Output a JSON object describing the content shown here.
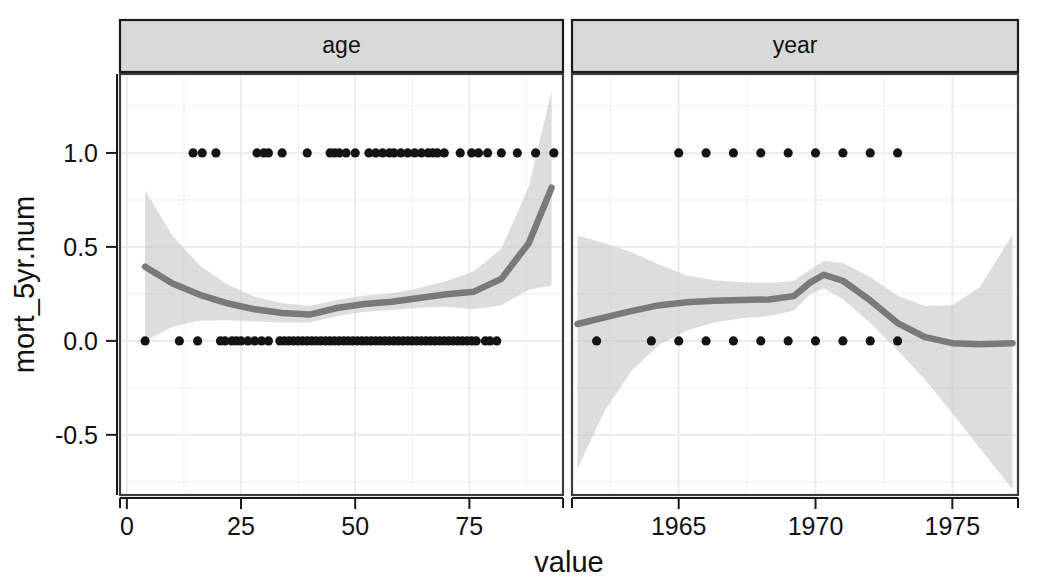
{
  "figure": {
    "xlabel": "value",
    "ylabel": "mort_5yr.num",
    "background": "#ffffff",
    "strip_fill": "#d9d9d9",
    "line_color": "#7a7a7a",
    "ribbon_color": "#c8c8c8",
    "point_color": "#141414"
  },
  "chart_data": {
    "type": "scatter",
    "title": "",
    "subtitle": "",
    "xlabel": "value",
    "ylabel": "mort_5yr.num",
    "grid": true,
    "legend": "none",
    "facet_variable": "variable",
    "facets": [
      {
        "label": "age",
        "xlabel": "value",
        "ylabel": "mort_5yr.num",
        "xticks": [
          0,
          25,
          50,
          75
        ],
        "xticklabels": [
          "0",
          "25",
          "50",
          "75"
        ],
        "yticks": [
          -0.5,
          0.0,
          0.5,
          1.0
        ],
        "yticklabels": [
          "-0.5",
          "0.0",
          "0.5",
          "1.0"
        ],
        "xlim": [
          -1.5,
          95.5
        ],
        "ylim": [
          -0.82,
          1.42
        ],
        "points": [
          {
            "x": 4.0,
            "y": 0.0
          },
          {
            "x": 14.5,
            "y": 1.0
          },
          {
            "x": 16.5,
            "y": 1.0
          },
          {
            "x": 19.5,
            "y": 1.0
          },
          {
            "x": 11.5,
            "y": 0.0
          },
          {
            "x": 15.5,
            "y": 0.0
          },
          {
            "x": 20.5,
            "y": 0.0
          },
          {
            "x": 21.5,
            "y": 0.0
          },
          {
            "x": 23.0,
            "y": 0.0
          },
          {
            "x": 24.0,
            "y": 0.0
          },
          {
            "x": 25.0,
            "y": 0.0
          },
          {
            "x": 26.5,
            "y": 0.0
          },
          {
            "x": 28.5,
            "y": 1.0
          },
          {
            "x": 30.0,
            "y": 1.0
          },
          {
            "x": 31.0,
            "y": 1.0
          },
          {
            "x": 34.0,
            "y": 1.0
          },
          {
            "x": 28.0,
            "y": 0.0
          },
          {
            "x": 29.5,
            "y": 0.0
          },
          {
            "x": 31.0,
            "y": 0.0
          },
          {
            "x": 33.5,
            "y": 0.0
          },
          {
            "x": 34.5,
            "y": 0.0
          },
          {
            "x": 35.5,
            "y": 0.0
          },
          {
            "x": 36.5,
            "y": 0.0
          },
          {
            "x": 37.5,
            "y": 0.0
          },
          {
            "x": 38.5,
            "y": 0.0
          },
          {
            "x": 39.5,
            "y": 0.0
          },
          {
            "x": 40.5,
            "y": 0.0
          },
          {
            "x": 41.5,
            "y": 0.0
          },
          {
            "x": 42.5,
            "y": 0.0
          },
          {
            "x": 43.5,
            "y": 0.0
          },
          {
            "x": 44.5,
            "y": 0.0
          },
          {
            "x": 39.5,
            "y": 1.0
          },
          {
            "x": 44.5,
            "y": 1.0
          },
          {
            "x": 45.5,
            "y": 1.0
          },
          {
            "x": 46.5,
            "y": 1.0
          },
          {
            "x": 48.0,
            "y": 1.0
          },
          {
            "x": 50.0,
            "y": 1.0
          },
          {
            "x": 45.5,
            "y": 0.0
          },
          {
            "x": 46.5,
            "y": 0.0
          },
          {
            "x": 47.5,
            "y": 0.0
          },
          {
            "x": 48.5,
            "y": 0.0
          },
          {
            "x": 49.5,
            "y": 0.0
          },
          {
            "x": 50.5,
            "y": 0.0
          },
          {
            "x": 51.5,
            "y": 0.0
          },
          {
            "x": 52.5,
            "y": 0.0
          },
          {
            "x": 53.5,
            "y": 0.0
          },
          {
            "x": 54.5,
            "y": 0.0
          },
          {
            "x": 55.5,
            "y": 0.0
          },
          {
            "x": 56.5,
            "y": 0.0
          },
          {
            "x": 57.5,
            "y": 0.0
          },
          {
            "x": 58.5,
            "y": 0.0
          },
          {
            "x": 53.0,
            "y": 1.0
          },
          {
            "x": 54.5,
            "y": 1.0
          },
          {
            "x": 56.0,
            "y": 1.0
          },
          {
            "x": 57.5,
            "y": 1.0
          },
          {
            "x": 58.5,
            "y": 1.0
          },
          {
            "x": 60.0,
            "y": 1.0
          },
          {
            "x": 61.5,
            "y": 1.0
          },
          {
            "x": 63.0,
            "y": 1.0
          },
          {
            "x": 64.5,
            "y": 1.0
          },
          {
            "x": 59.5,
            "y": 0.0
          },
          {
            "x": 60.5,
            "y": 0.0
          },
          {
            "x": 61.5,
            "y": 0.0
          },
          {
            "x": 62.5,
            "y": 0.0
          },
          {
            "x": 63.5,
            "y": 0.0
          },
          {
            "x": 64.5,
            "y": 0.0
          },
          {
            "x": 65.5,
            "y": 0.0
          },
          {
            "x": 66.5,
            "y": 0.0
          },
          {
            "x": 67.5,
            "y": 0.0
          },
          {
            "x": 68.5,
            "y": 0.0
          },
          {
            "x": 69.5,
            "y": 0.0
          },
          {
            "x": 70.5,
            "y": 0.0
          },
          {
            "x": 66.0,
            "y": 1.0
          },
          {
            "x": 67.0,
            "y": 1.0
          },
          {
            "x": 68.0,
            "y": 1.0
          },
          {
            "x": 69.5,
            "y": 1.0
          },
          {
            "x": 71.5,
            "y": 0.0
          },
          {
            "x": 72.5,
            "y": 0.0
          },
          {
            "x": 73.5,
            "y": 0.0
          },
          {
            "x": 74.5,
            "y": 0.0
          },
          {
            "x": 75.5,
            "y": 0.0
          },
          {
            "x": 76.5,
            "y": 0.0
          },
          {
            "x": 73.0,
            "y": 1.0
          },
          {
            "x": 75.5,
            "y": 1.0
          },
          {
            "x": 77.0,
            "y": 1.0
          },
          {
            "x": 79.0,
            "y": 1.0
          },
          {
            "x": 82.0,
            "y": 1.0
          },
          {
            "x": 85.5,
            "y": 1.0
          },
          {
            "x": 78.5,
            "y": 0.0
          },
          {
            "x": 79.5,
            "y": 0.0
          },
          {
            "x": 81.0,
            "y": 0.0
          },
          {
            "x": 89.5,
            "y": 1.0
          },
          {
            "x": 93.5,
            "y": 1.0
          }
        ],
        "smooth": {
          "x": [
            4,
            10,
            16,
            22,
            28,
            34,
            40,
            46,
            52,
            58,
            64,
            70,
            76,
            82,
            88,
            93
          ],
          "y": [
            0.395,
            0.305,
            0.245,
            0.2,
            0.168,
            0.148,
            0.14,
            0.175,
            0.196,
            0.208,
            0.228,
            0.248,
            0.262,
            0.33,
            0.52,
            0.815
          ],
          "ymin": [
            0.0,
            0.075,
            0.108,
            0.11,
            0.105,
            0.098,
            0.098,
            0.133,
            0.155,
            0.164,
            0.176,
            0.182,
            0.168,
            0.19,
            0.272,
            0.295
          ],
          "ymax": [
            0.8,
            0.56,
            0.4,
            0.3,
            0.235,
            0.2,
            0.185,
            0.218,
            0.24,
            0.254,
            0.282,
            0.318,
            0.37,
            0.49,
            0.82,
            1.33
          ]
        }
      },
      {
        "label": "year",
        "xlabel": "value",
        "ylabel": "mort_5yr.num",
        "xticks": [
          1965,
          1970,
          1975
        ],
        "xticklabels": [
          "1965",
          "1970",
          "1975"
        ],
        "yticks": [
          -0.5,
          0.0,
          0.5,
          1.0
        ],
        "yticklabels": [
          "-0.5",
          "0.0",
          "0.5",
          "1.0"
        ],
        "xlim": [
          1961.1,
          1977.4
        ],
        "ylim": [
          -0.82,
          1.42
        ],
        "points": [
          {
            "x": 1962.0,
            "y": 0.0
          },
          {
            "x": 1964.0,
            "y": 0.0
          },
          {
            "x": 1965.0,
            "y": 0.0
          },
          {
            "x": 1966.0,
            "y": 0.0
          },
          {
            "x": 1967.0,
            "y": 0.0
          },
          {
            "x": 1968.0,
            "y": 0.0
          },
          {
            "x": 1969.0,
            "y": 0.0
          },
          {
            "x": 1970.0,
            "y": 0.0
          },
          {
            "x": 1971.0,
            "y": 0.0
          },
          {
            "x": 1972.0,
            "y": 0.0
          },
          {
            "x": 1973.0,
            "y": 0.0
          },
          {
            "x": 1965.0,
            "y": 1.0
          },
          {
            "x": 1966.0,
            "y": 1.0
          },
          {
            "x": 1967.0,
            "y": 1.0
          },
          {
            "x": 1968.0,
            "y": 1.0
          },
          {
            "x": 1969.0,
            "y": 1.0
          },
          {
            "x": 1970.0,
            "y": 1.0
          },
          {
            "x": 1971.0,
            "y": 1.0
          },
          {
            "x": 1972.0,
            "y": 1.0
          },
          {
            "x": 1973.0,
            "y": 1.0
          }
        ],
        "smooth": {
          "x": [
            1961.3,
            1962.3,
            1963.3,
            1964.3,
            1965.3,
            1966.3,
            1967.3,
            1968.3,
            1969.2,
            1969.8,
            1970.3,
            1971.0,
            1972.0,
            1973.0,
            1974.0,
            1975.0,
            1976.0,
            1977.2
          ],
          "y": [
            0.09,
            0.125,
            0.16,
            0.19,
            0.205,
            0.213,
            0.218,
            0.22,
            0.238,
            0.31,
            0.352,
            0.32,
            0.215,
            0.095,
            0.02,
            -0.012,
            -0.018,
            -0.012
          ],
          "ymin": [
            -0.68,
            -0.37,
            -0.155,
            -0.02,
            0.055,
            0.098,
            0.12,
            0.132,
            0.16,
            0.248,
            0.28,
            0.222,
            0.095,
            -0.05,
            -0.205,
            -0.385,
            -0.57,
            -0.79
          ],
          "ymax": [
            0.56,
            0.52,
            0.47,
            0.405,
            0.348,
            0.322,
            0.312,
            0.308,
            0.318,
            0.378,
            0.425,
            0.415,
            0.34,
            0.24,
            0.185,
            0.19,
            0.285,
            0.565
          ]
        }
      }
    ]
  }
}
